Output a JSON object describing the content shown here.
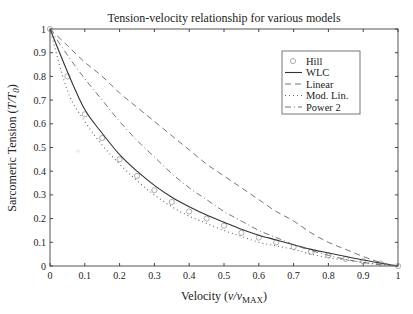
{
  "chart_data": {
    "type": "line",
    "title": "Tension-velocity relationship for various models",
    "xlabel": "Velocity (v/v_MAX)",
    "xlabel_parts": {
      "prefix": "Velocity (",
      "var": "v/v",
      "sub": "MAX",
      "suffix": ")"
    },
    "ylabel": "Sarcomeric Tension (T/T_0)",
    "ylabel_parts": {
      "prefix": "Sarcomeric Tension (",
      "var": "T/T",
      "sub": "0",
      "suffix": ")"
    },
    "xlim": [
      0,
      1
    ],
    "ylim": [
      0,
      1
    ],
    "xticks": [
      "0",
      "0.1",
      "0.2",
      "0.3",
      "0.4",
      "0.5",
      "0.6",
      "0.7",
      "0.8",
      "0.9",
      "1"
    ],
    "yticks": [
      "0",
      "0.1",
      "0.2",
      "0.3",
      "0.4",
      "0.5",
      "0.6",
      "0.7",
      "0.8",
      "0.9",
      "1"
    ],
    "grid": false,
    "legend_position": "upper right",
    "x": [
      0,
      0.05,
      0.1,
      0.15,
      0.2,
      0.25,
      0.3,
      0.35,
      0.4,
      0.45,
      0.5,
      0.55,
      0.6,
      0.65,
      0.7,
      0.75,
      0.8,
      0.85,
      0.9,
      0.95,
      1.0
    ],
    "series": [
      {
        "name": "Hill",
        "style": "circle-markers",
        "values": [
          1.0,
          0.8,
          0.64,
          0.54,
          0.45,
          0.38,
          0.32,
          0.27,
          0.23,
          0.2,
          0.17,
          0.14,
          0.12,
          0.1,
          0.08,
          0.06,
          0.045,
          0.03,
          0.02,
          0.01,
          0.0
        ]
      },
      {
        "name": "WLC",
        "style": "solid",
        "values": [
          1.0,
          0.82,
          0.66,
          0.56,
          0.47,
          0.4,
          0.34,
          0.29,
          0.25,
          0.215,
          0.185,
          0.155,
          0.13,
          0.11,
          0.09,
          0.07,
          0.055,
          0.04,
          0.025,
          0.012,
          0.0
        ]
      },
      {
        "name": "Linear",
        "style": "dashed",
        "values": [
          1.0,
          0.93,
          0.86,
          0.8,
          0.73,
          0.67,
          0.61,
          0.55,
          0.49,
          0.43,
          0.38,
          0.33,
          0.28,
          0.23,
          0.19,
          0.14,
          0.1,
          0.07,
          0.04,
          0.015,
          0.0
        ]
      },
      {
        "name": "Mod. Lin.",
        "style": "dotted",
        "values": [
          1.0,
          0.74,
          0.61,
          0.51,
          0.43,
          0.36,
          0.3,
          0.25,
          0.21,
          0.18,
          0.15,
          0.125,
          0.1,
          0.085,
          0.07,
          0.05,
          0.035,
          0.025,
          0.015,
          0.007,
          0.0
        ]
      },
      {
        "name": "Power 2",
        "style": "dash-dot",
        "values": [
          1.0,
          0.89,
          0.79,
          0.7,
          0.61,
          0.53,
          0.46,
          0.39,
          0.33,
          0.28,
          0.23,
          0.19,
          0.15,
          0.12,
          0.09,
          0.065,
          0.045,
          0.028,
          0.015,
          0.005,
          0.0
        ]
      }
    ]
  },
  "legend": {
    "items": [
      {
        "label": "Hill",
        "style": "circle-markers"
      },
      {
        "label": "WLC",
        "style": "solid"
      },
      {
        "label": "Linear",
        "style": "dashed"
      },
      {
        "label": "Mod. Lin.",
        "style": "dotted"
      },
      {
        "label": "Power 2",
        "style": "dash-dot"
      }
    ]
  },
  "colors": {
    "axis": "#444444",
    "line": "#333333",
    "marker": "#999999",
    "background": "#ffffff"
  }
}
